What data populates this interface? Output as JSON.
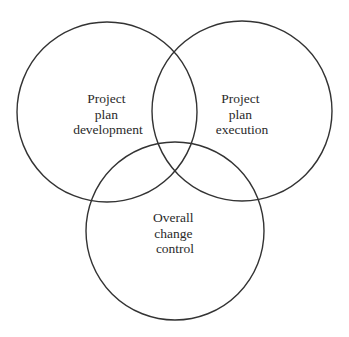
{
  "diagram": {
    "type": "venn",
    "stroke_color": "#333333",
    "background": "#ffffff",
    "circles": [
      {
        "id": "development",
        "cx": 107,
        "cy": 112,
        "r": 90,
        "lines": [
          "Project",
          "plan",
          "development"
        ],
        "label_x": 108,
        "label_y": 103
      },
      {
        "id": "execution",
        "cx": 242,
        "cy": 111,
        "r": 90,
        "lines": [
          "Project",
          "plan",
          "execution"
        ],
        "label_x": 242,
        "label_y": 103
      },
      {
        "id": "change-control",
        "cx": 175,
        "cy": 231,
        "r": 89,
        "lines": [
          "Overall",
          "change",
          "control"
        ],
        "label_x": 175,
        "label_y": 222
      }
    ]
  }
}
